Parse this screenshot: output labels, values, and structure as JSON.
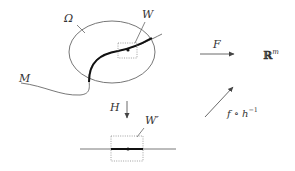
{
  "diagram": {
    "labels": {
      "omega": "Ω",
      "W": "W",
      "M": "M",
      "F": "F",
      "target_space": "ℝ",
      "target_exp": "m",
      "H": "H",
      "W_prime": "W′",
      "composite": "f ∘ h",
      "composite_exp": "−1"
    },
    "colors": {
      "stroke": "#555555",
      "thick": "#111111",
      "dotted": "#888888",
      "text": "#333333"
    }
  }
}
